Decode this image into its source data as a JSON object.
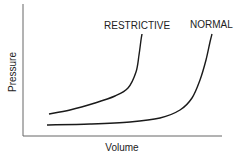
{
  "chart_data": {
    "type": "line",
    "title": "",
    "xlabel": "Volume",
    "ylabel": "Pressure",
    "grid": false,
    "legend": "inline labels at curve tops",
    "axis_ticks": "none",
    "series": [
      {
        "name": "RESTRICTIVE",
        "description": "Pressure rises steeply at lower volume",
        "points": [
          [
            49,
            114
          ],
          [
            70,
            110
          ],
          [
            95,
            103
          ],
          [
            115,
            96
          ],
          [
            128,
            88
          ],
          [
            136,
            72
          ],
          [
            139,
            55
          ],
          [
            141,
            40
          ],
          [
            142,
            34
          ]
        ]
      },
      {
        "name": "NORMAL",
        "description": "Low pressure over a wide volume range, then steep rise",
        "points": [
          [
            47,
            125
          ],
          [
            90,
            124
          ],
          [
            130,
            122
          ],
          [
            160,
            118
          ],
          [
            180,
            110
          ],
          [
            192,
            98
          ],
          [
            200,
            80
          ],
          [
            206,
            60
          ],
          [
            210,
            42
          ],
          [
            212,
            34
          ]
        ]
      }
    ]
  },
  "labels": {
    "restrictive": "RESTRICTIVE",
    "normal": "NORMAL",
    "x_axis": "Volume",
    "y_axis": "Pressure"
  },
  "colors": {
    "axis": "#666666",
    "curve": "#1a1a1a",
    "text": "#222222"
  }
}
